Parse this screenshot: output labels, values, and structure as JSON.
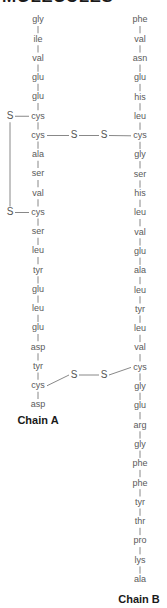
{
  "header": {
    "title": "MOLECULES"
  },
  "chains": [
    {
      "id": "A",
      "label": "Chain A",
      "residues": [
        "gly",
        "ile",
        "val",
        "glu",
        "glu",
        "cys",
        "cys",
        "ala",
        "ser",
        "val",
        "cys",
        "ser",
        "leu",
        "tyr",
        "glu",
        "leu",
        "glu",
        "asp",
        "tyr",
        "cys",
        "asp"
      ]
    },
    {
      "id": "B",
      "label": "Chain B",
      "residues": [
        "phe",
        "val",
        "asn",
        "glu",
        "his",
        "leu",
        "cys",
        "gly",
        "ser",
        "his",
        "leu",
        "val",
        "glu",
        "ala",
        "leu",
        "tyr",
        "leu",
        "val",
        "cys",
        "gly",
        "glu",
        "arg",
        "gly",
        "phe",
        "phe",
        "tyr",
        "thr",
        "pro",
        "lys",
        "ala"
      ]
    }
  ],
  "bonds": {
    "sulfur_symbol": "S",
    "intrachain": [
      {
        "chain": "A",
        "from_index": 5,
        "to_index": 10,
        "description": "cys6–cys11 disulfide bridge within Chain A"
      }
    ],
    "interchain": [
      {
        "a_index": 6,
        "b_index": 6,
        "description": "Chain A cys7 – Chain B cys7 disulfide bridge"
      },
      {
        "a_index": 19,
        "b_index": 18,
        "description": "Chain A cys20 – Chain B cys19 disulfide bridge"
      }
    ]
  },
  "colors": {
    "residue_text": "#5a5a5a",
    "bond_line": "#7a7a7a",
    "label_text": "#1a1a1a",
    "background": "#ffffff"
  }
}
